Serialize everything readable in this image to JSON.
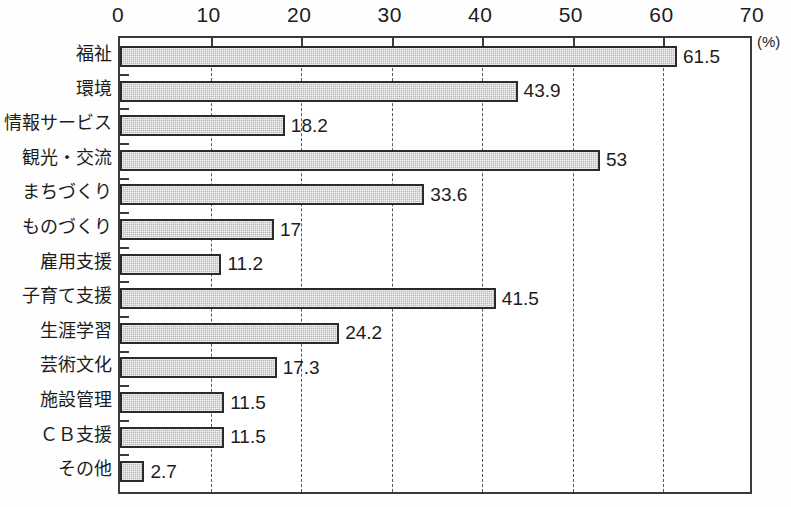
{
  "chart_data": {
    "type": "bar",
    "orientation": "horizontal",
    "title": "",
    "subtitle": "",
    "xlabel": "",
    "ylabel": "",
    "unit_label": "(%)",
    "xlim": [
      0,
      70
    ],
    "xticks": [
      0,
      10,
      20,
      30,
      40,
      50,
      60,
      70
    ],
    "xtick_labels": [
      "0",
      "10",
      "20",
      "30",
      "40",
      "50",
      "60",
      "70"
    ],
    "grid": true,
    "grid_axis": "x",
    "grid_style": "dashed",
    "legend": false,
    "legend_position": "none",
    "bar_fill_color": "#b8b8b8",
    "bar_border_color": "#2b2b2b",
    "frame_color": "#3a3a3a",
    "categories": [
      "福祉",
      "環境",
      "情報サービス",
      "観光・交流",
      "まちづくり",
      "ものづくり",
      "雇用支援",
      "子育て支援",
      "生涯学習",
      "芸術文化",
      "施設管理",
      "ＣＢ支援",
      "その他"
    ],
    "values": [
      61.5,
      43.9,
      18.2,
      53,
      33.6,
      17,
      11.2,
      41.5,
      24.2,
      17.3,
      11.5,
      11.5,
      2.7
    ],
    "value_labels": [
      "61.5",
      "43.9",
      "18.2",
      "53",
      "33.6",
      "17",
      "11.2",
      "41.5",
      "24.2",
      "17.3",
      "11.5",
      "11.5",
      "2.7"
    ]
  }
}
